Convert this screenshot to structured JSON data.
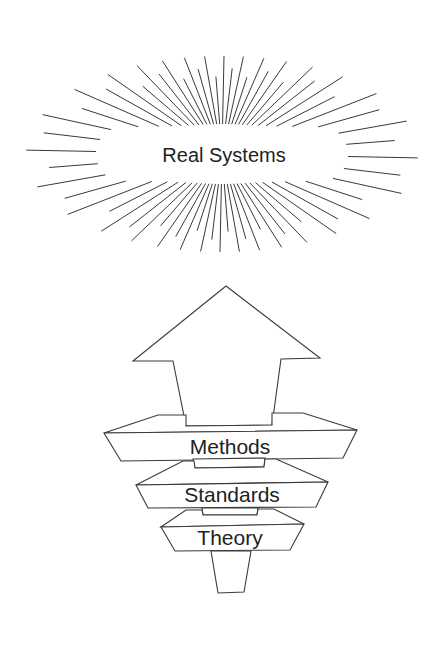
{
  "diagram": {
    "title_burst": {
      "label": "Real Systems",
      "center": [
        222,
        154
      ],
      "inner_half_width": 122,
      "inner_half_height": 26,
      "ray_count": 64,
      "ray_color": "#3a3a3a"
    },
    "arrow": {
      "direction": "up",
      "tip": [
        226,
        286
      ],
      "head_left": [
        133,
        361
      ],
      "head_right": [
        320,
        358
      ],
      "shaft_top_left": [
        173,
        361
      ],
      "shaft_top_right": [
        281,
        359
      ],
      "shaft_bottom_left": [
        186,
        426
      ],
      "shaft_bottom_right": [
        272,
        425
      ]
    },
    "layers": [
      {
        "id": "methods",
        "label": "Methods",
        "back_left": [
          158,
          415
        ],
        "back_right": [
          303,
          413
        ],
        "front_left": [
          104,
          433
        ],
        "front_right": [
          357,
          430
        ],
        "bottom_left": [
          121,
          461
        ],
        "bottom_right": [
          343,
          458
        ]
      },
      {
        "id": "standards",
        "label": "Standards",
        "back_left": [
          183,
          461
        ],
        "back_right": [
          276,
          459
        ],
        "front_left": [
          136,
          485
        ],
        "front_right": [
          328,
          482
        ],
        "bottom_left": [
          148,
          508
        ],
        "bottom_right": [
          316,
          507
        ]
      },
      {
        "id": "theory",
        "label": "Theory",
        "back_left": [
          186,
          510
        ],
        "back_right": [
          274,
          509
        ],
        "front_left": [
          161,
          527
        ],
        "front_right": [
          304,
          524
        ],
        "bottom_left": [
          175,
          551
        ],
        "bottom_right": [
          290,
          550
        ]
      }
    ],
    "connectors": [
      {
        "top_left": [
          193,
          459
        ],
        "top_right": [
          265,
          458
        ],
        "bottom_left": [
          195,
          468
        ],
        "bottom_right": [
          264,
          467
        ]
      },
      {
        "top_left": [
          202,
          508
        ],
        "top_right": [
          258,
          508
        ],
        "bottom_left": [
          203,
          515
        ],
        "bottom_right": [
          257,
          515
        ]
      }
    ],
    "foot": {
      "top_left": [
        211,
        551
      ],
      "top_right": [
        251,
        551
      ],
      "bottom_left": [
        218,
        593
      ],
      "bottom_right": [
        244,
        592
      ]
    },
    "stroke_color": "#3a3a3a",
    "text_color": "#222222"
  }
}
